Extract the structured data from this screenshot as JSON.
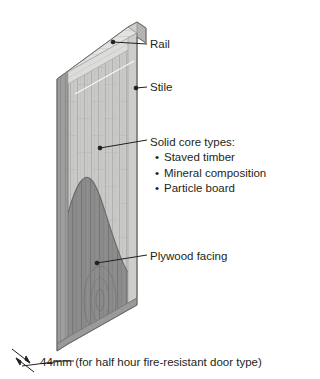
{
  "figure": {
    "view": "isometric cutaway"
  },
  "labels": {
    "rail": "Rail",
    "stile": "Stile",
    "core_heading": "Solid core types:",
    "core_items": [
      "Staved timber",
      "Mineral composition",
      "Particle board"
    ],
    "plywood": "Plywood facing",
    "dimension": "44mm (for half hour fire-resistant door type)",
    "bullet": "•"
  },
  "colors": {
    "core_light": "#c9c9c7",
    "core_edge": "#b3b3b1",
    "facing_gray": "#8b8b8b",
    "facing_dark": "#6f6f6f",
    "top_edge": "#e2e2e0",
    "side_edge": "#9c9c9a",
    "leader": "#231f20",
    "text": "#231f20",
    "background": "#ffffff"
  },
  "parts": {
    "rail_desc": "top horizontal frame member",
    "stile_desc": "vertical edge frame member",
    "core_desc": "vertical staved solid core",
    "facing_desc": "plywood facing peeled back in S-curve"
  }
}
